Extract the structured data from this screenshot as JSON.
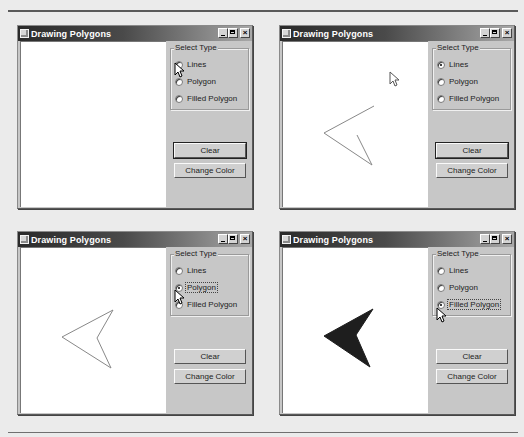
{
  "screens": [
    {
      "title": "Drawing Polygons",
      "group_label": "Select Type",
      "radios": [
        {
          "label": "Lines",
          "checked": false,
          "focused": false
        },
        {
          "label": "Polygon",
          "checked": false,
          "focused": false
        },
        {
          "label": "Filled Polygon",
          "checked": false,
          "focused": false
        }
      ],
      "buttons": {
        "clear": "Clear",
        "change_color": "Change Color"
      },
      "shape": {
        "type": "none",
        "points": []
      },
      "cursor": "over-lines-radio"
    },
    {
      "title": "Drawing Polygons",
      "group_label": "Select Type",
      "radios": [
        {
          "label": "Lines",
          "checked": true,
          "focused": false
        },
        {
          "label": "Polygon",
          "checked": false,
          "focused": false
        },
        {
          "label": "Filled Polygon",
          "checked": false,
          "focused": false
        }
      ],
      "buttons": {
        "clear": "Clear",
        "change_color": "Change Color"
      },
      "shape": {
        "type": "polyline",
        "points": "91,64 41,91 89,123 74,93"
      },
      "cursor": "over-canvas"
    },
    {
      "title": "Drawing Polygons",
      "group_label": "Select Type",
      "radios": [
        {
          "label": "Lines",
          "checked": false,
          "focused": false
        },
        {
          "label": "Polygon",
          "checked": true,
          "focused": true
        },
        {
          "label": "Filled Polygon",
          "checked": false,
          "focused": false
        }
      ],
      "buttons": {
        "clear": "Clear",
        "change_color": "Change Color"
      },
      "shape": {
        "type": "polygon",
        "points": "92,62 41,89 90,120 76,90"
      },
      "cursor": "over-polygon-radio"
    },
    {
      "title": "Drawing Polygons",
      "group_label": "Select Type",
      "radios": [
        {
          "label": "Lines",
          "checked": false,
          "focused": false
        },
        {
          "label": "Polygon",
          "checked": false,
          "focused": false
        },
        {
          "label": "Filled Polygon",
          "checked": true,
          "focused": true
        }
      ],
      "buttons": {
        "clear": "Clear",
        "change_color": "Change Color"
      },
      "shape": {
        "type": "filled-polygon",
        "points": "90,61 41,88 87,119 73,87",
        "fill": "#1e1e1e"
      },
      "cursor": "over-filled-radio"
    }
  ],
  "colors": {
    "window_face": "#c7c7c7",
    "canvas": "#ffffff",
    "line_color": "#888888",
    "fill_color": "#1e1e1e"
  }
}
